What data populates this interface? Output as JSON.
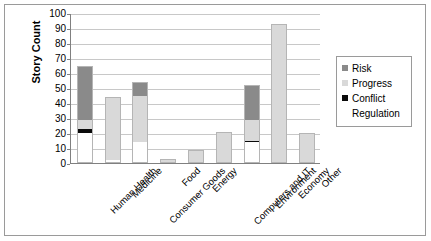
{
  "chart_data": {
    "type": "bar",
    "stacked": true,
    "title": "",
    "xlabel": "",
    "ylabel": "Story Count",
    "ylim": [
      0,
      100
    ],
    "ytick_step": 10,
    "yticks": [
      0,
      10,
      20,
      30,
      40,
      50,
      60,
      70,
      80,
      90,
      100
    ],
    "grid": true,
    "legend_position": "right",
    "categories": [
      "Human Health",
      "Medicine",
      "Consumer Goods",
      "Food",
      "Energy",
      "Computers and IT",
      "Environment",
      "Economy",
      "Other"
    ],
    "series": [
      {
        "name": "Regulation",
        "color": "#ffffff",
        "values": [
          20,
          2,
          14,
          0,
          0,
          0,
          14,
          0,
          0
        ]
      },
      {
        "name": "Conflict",
        "color": "#0a0a0a",
        "values": [
          3,
          0,
          0,
          0,
          0,
          0,
          1,
          0,
          1
        ]
      },
      {
        "name": "Progress",
        "color": "#d9d9d9",
        "values": [
          6,
          42,
          31,
          3,
          9,
          21,
          14,
          92,
          19
        ]
      },
      {
        "name": "Risk",
        "color": "#8a8a8a",
        "values": [
          36,
          0,
          9,
          0,
          0,
          0,
          23,
          1,
          0
        ]
      }
    ],
    "totals": [
      65,
      44,
      54,
      3,
      9,
      21,
      52,
      93,
      20
    ],
    "stack_order_bottom_to_top": [
      "Regulation",
      "Conflict",
      "Progress",
      "Risk"
    ]
  },
  "legend": {
    "items": [
      {
        "label": "Risk",
        "swatch": "#8a8a8a",
        "has_swatch": true
      },
      {
        "label": "Progress",
        "swatch": "#d9d9d9",
        "has_swatch": true
      },
      {
        "label": "Conflict",
        "swatch": "#0a0a0a",
        "has_swatch": true
      },
      {
        "label": "Regulation",
        "swatch": "#ffffff",
        "has_swatch": false
      }
    ]
  },
  "axes": {
    "y_title": "Story Count"
  }
}
